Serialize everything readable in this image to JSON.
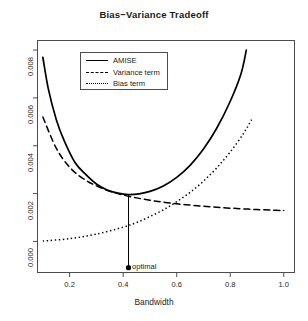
{
  "chart_data": {
    "type": "line",
    "title": "Bias−Variance Tradeoff",
    "xlabel": "Bandwidth",
    "ylabel": "",
    "xlim": [
      0.08,
      1.04
    ],
    "ylim": [
      -0.00013,
      0.00084
    ],
    "grid": false,
    "legend_position": "top-left-inside",
    "xticks": [
      0.2,
      0.4,
      0.6,
      0.8,
      1.0
    ],
    "xtick_labels": [
      "0.2",
      "0.4",
      "0.6",
      "0.8",
      "1.0"
    ],
    "yticks": [
      0.0,
      0.0002,
      0.0004,
      0.0006,
      0.0008
    ],
    "ytick_labels": [
      "0.000",
      "0.002",
      "0.004",
      "0.006",
      "0.008"
    ],
    "annotations": [
      {
        "text": "optimal",
        "x": 0.42,
        "y": -0.00011,
        "marker": "filled-circle"
      }
    ],
    "reference_lines": [
      {
        "orientation": "vertical",
        "x": 0.42,
        "y_from": -0.00011,
        "y_to": 0.000196,
        "style": "solid"
      }
    ],
    "series": [
      {
        "name": "AMISE",
        "style": "solid",
        "x": [
          0.1,
          0.12,
          0.15,
          0.18,
          0.22,
          0.26,
          0.3,
          0.34,
          0.38,
          0.42,
          0.46,
          0.5,
          0.55,
          0.6,
          0.65,
          0.7,
          0.75,
          0.8,
          0.84,
          0.86
        ],
        "values": [
          0.00077,
          0.00064,
          0.00051,
          0.00042,
          0.00033,
          0.00028,
          0.00024,
          0.000215,
          0.000202,
          0.000196,
          0.000199,
          0.000209,
          0.000232,
          0.000268,
          0.000318,
          0.000386,
          0.000474,
          0.000586,
          0.0007,
          0.0008
        ]
      },
      {
        "name": "Variance term",
        "style": "dashed",
        "x": [
          0.1,
          0.15,
          0.2,
          0.25,
          0.3,
          0.35,
          0.4,
          0.45,
          0.5,
          0.55,
          0.6,
          0.65,
          0.7,
          0.75,
          0.8,
          0.85,
          0.9,
          0.95,
          1.0
        ],
        "values": [
          0.00052,
          0.00039,
          0.00031,
          0.000263,
          0.000232,
          0.00021,
          0.000194,
          0.000182,
          0.000172,
          0.000164,
          0.000157,
          0.000152,
          0.000147,
          0.000143,
          0.000139,
          0.000136,
          0.000133,
          0.000131,
          0.000129
        ]
      },
      {
        "name": "Bias term",
        "style": "dotted",
        "x": [
          0.1,
          0.2,
          0.3,
          0.4,
          0.45,
          0.5,
          0.55,
          0.6,
          0.65,
          0.7,
          0.75,
          0.8,
          0.85,
          0.88
        ],
        "values": [
          1.5e-06,
          1.15e-05,
          3.05e-05,
          5.95e-05,
          7.9e-05,
          0.000104,
          0.000132,
          0.000166,
          0.000205,
          0.000252,
          0.000308,
          0.000374,
          0.000452,
          0.00051
        ]
      }
    ]
  },
  "legend": {
    "entries": [
      {
        "label": "AMISE",
        "key": "solid-line-key"
      },
      {
        "label": "Variance term",
        "key": "dashed-line-key"
      },
      {
        "label": "Bias term",
        "key": "dotted-line-key"
      }
    ]
  },
  "colors": {
    "line": "#000000",
    "frame": "#4d4d4d",
    "text": "#1a1a1a"
  }
}
